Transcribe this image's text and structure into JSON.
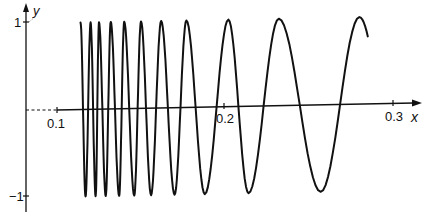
{
  "chart_data": {
    "type": "line",
    "title": "",
    "xlabel": "x",
    "ylabel": "y",
    "function_description": "oscillating chirp with frequency decreasing as x increases (amplitude 1)",
    "x_ticks": [
      "0.1",
      "0.2",
      "0.3"
    ],
    "y_ticks": [
      "1",
      "−1"
    ],
    "xlim": [
      0.08,
      0.32
    ],
    "ylim": [
      -1,
      1
    ],
    "x_start": 0.114,
    "x_end": 0.285,
    "peaks_x": [
      0.114,
      0.12,
      0.125,
      0.132,
      0.14,
      0.15,
      0.162,
      0.177,
      0.202,
      0.232,
      0.28
    ],
    "troughs_x": [
      0.117,
      0.123,
      0.129,
      0.137,
      0.146,
      0.156,
      0.17,
      0.188,
      0.214,
      0.257
    ],
    "grid": false,
    "legend": null
  },
  "labels": {
    "x_axis": "x",
    "y_axis": "y",
    "tick_x1": "0.1",
    "tick_x2": "0.2",
    "tick_x3": "0.3",
    "tick_y_pos": "1",
    "tick_y_neg": "−1"
  }
}
